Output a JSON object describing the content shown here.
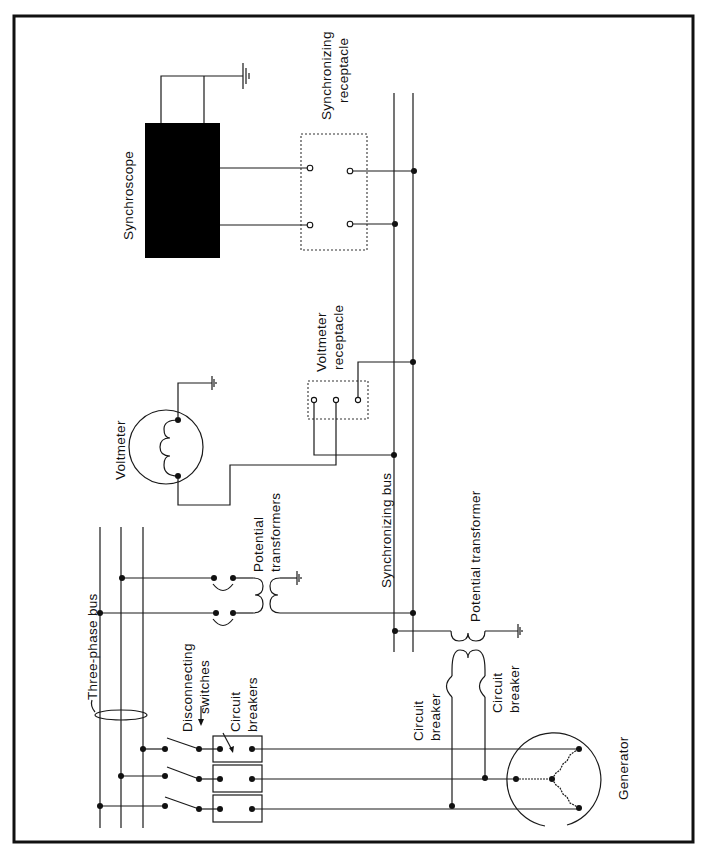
{
  "diagram": {
    "orientation": "rotated 90° counter-clockwise",
    "labels": {
      "synchroscope": "Synchroscope",
      "synchronizing_receptacle_1": "Synchronizing",
      "synchronizing_receptacle_2": "receptacle",
      "voltmeter": "Voltmeter",
      "voltmeter_receptacle_1": "Voltmeter",
      "voltmeter_receptacle_2": "receptacle",
      "synchronizing_bus": "Synchronizing bus",
      "potential_transformers_1": "Potential",
      "potential_transformers_2": "transformers",
      "potential_transformer": "Potential transformer",
      "three_phase_bus": "Three-phase bus",
      "disconnecting_switches_1": "Disconnecting",
      "disconnecting_switches_2": "switches",
      "circuit_breakers_1": "Circuit",
      "circuit_breakers_2": "breakers",
      "circuit_breaker_left_1": "Circuit",
      "circuit_breaker_left_2": "breaker",
      "circuit_breaker_right_1": "Circuit",
      "circuit_breaker_right_2": "breaker",
      "generator": "Generator"
    },
    "components": [
      {
        "id": "synchroscope",
        "type": "meter-block",
        "fill": "#000000"
      },
      {
        "id": "synchronizing-receptacle",
        "type": "receptacle",
        "terminals": 4
      },
      {
        "id": "voltmeter",
        "type": "meter-circle",
        "coil": true
      },
      {
        "id": "voltmeter-receptacle",
        "type": "receptacle",
        "terminals": 3
      },
      {
        "id": "synchronizing-bus",
        "type": "bus",
        "conductors": 2
      },
      {
        "id": "potential-transformers",
        "type": "transformer",
        "count": 2
      },
      {
        "id": "potential-transformer",
        "type": "transformer",
        "count": 1
      },
      {
        "id": "three-phase-bus",
        "type": "bus",
        "conductors": 3
      },
      {
        "id": "disconnecting-switches",
        "type": "switch",
        "count": 3
      },
      {
        "id": "circuit-breakers",
        "type": "breaker",
        "count": 3
      },
      {
        "id": "generator",
        "type": "wye-generator",
        "phases": 3
      }
    ],
    "colors": {
      "line": "#1a1a1a",
      "background": "#ffffff",
      "synchroscope": "#000000"
    }
  }
}
